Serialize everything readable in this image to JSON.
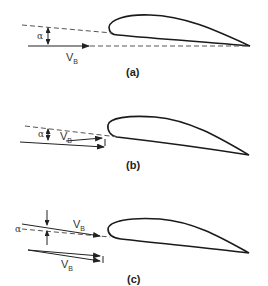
{
  "figure": {
    "panels": [
      {
        "id": "a",
        "caption": "(a)",
        "angle_label": "α",
        "velocity_label": "V",
        "velocity_subscript": "B"
      },
      {
        "id": "b",
        "caption": "(b)",
        "angle_label": "α",
        "velocity_label": "V",
        "velocity_subscript": "B"
      },
      {
        "id": "c",
        "caption": "(c)",
        "angle_label": "α",
        "velocity_label": "V",
        "velocity_subscript": "B",
        "second_velocity_label": "V",
        "second_velocity_subscript": "B"
      }
    ],
    "colors": {
      "line": "#1a1a1a",
      "dash": "#555555",
      "background": "#ffffff"
    }
  }
}
